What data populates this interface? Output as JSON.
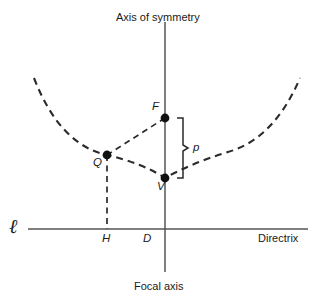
{
  "figure": {
    "background_color": "#ffffff",
    "ink_color": "#1a1a1a",
    "labels": {
      "axis_of_symmetry": "Axis of symmetry",
      "focal_axis": "Focal axis",
      "directrix": "Directrix",
      "focus_point": "F",
      "vertex_point": "V",
      "curve_point": "Q",
      "foot_point": "H",
      "directrix_intersection": "D",
      "focal_distance": "p",
      "directrix_line_symbol": "ℓ"
    },
    "geometry": {
      "vertical_axis": {
        "x": 165,
        "y_top": 22,
        "y_bottom": 272
      },
      "directrix_line": {
        "y": 229,
        "x_left": 28,
        "x_right": 308
      },
      "points": {
        "F": {
          "x": 165,
          "y": 118
        },
        "V": {
          "x": 165,
          "y": 178
        },
        "Q": {
          "x": 107,
          "y": 155
        },
        "H": {
          "x": 107,
          "y": 229
        },
        "D": {
          "x": 148,
          "y": 229
        }
      },
      "parabola": {
        "vertex": {
          "x": 165,
          "y": 178
        },
        "left_end": {
          "x": 34,
          "y": 78
        },
        "right_end": {
          "x": 300,
          "y": 78
        },
        "opens": "up"
      },
      "brace": {
        "x": 183,
        "y_top": 118,
        "y_bottom": 178,
        "tick_y": 148
      },
      "dashed_segments": [
        {
          "name": "focus-to-Q",
          "from": "F",
          "to": "Q"
        },
        {
          "name": "Q-to-H",
          "from": "Q",
          "to": "H"
        }
      ]
    },
    "style": {
      "solid_line_width": 1.4,
      "dash_pattern": "7 5",
      "point_radius": 4.2
    }
  }
}
